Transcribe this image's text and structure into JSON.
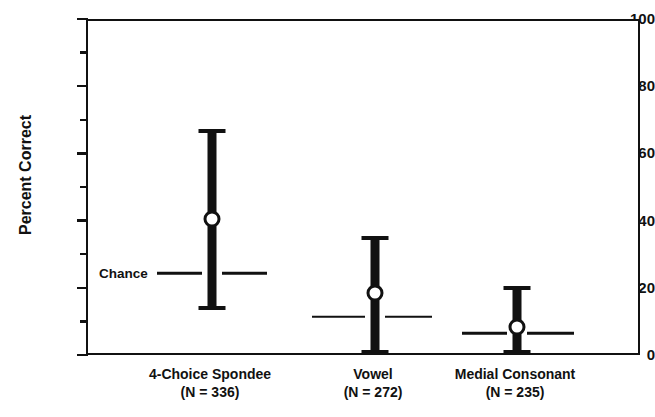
{
  "chart_data": {
    "type": "bar",
    "title": "",
    "xlabel": "",
    "ylabel": "Percent Correct",
    "ylim": [
      0,
      100
    ],
    "ytick_major": [
      0,
      20,
      40,
      60,
      80,
      100
    ],
    "ytick_minor": [
      10,
      30,
      50,
      70,
      90
    ],
    "ytick_labels": [
      "0",
      "20",
      "40",
      "60",
      "80",
      "100"
    ],
    "grid": false,
    "legend": "none",
    "chance_label": "Chance",
    "categories": [
      "4-Choice Spondee",
      "Vowel",
      "Medial Consonant"
    ],
    "category_n": [
      "(N = 336)",
      "(N = 272)",
      "(N = 235)"
    ],
    "series": [
      {
        "name": "mean",
        "marker": "open-circle",
        "values": [
          41,
          19,
          9
        ]
      },
      {
        "name": "range-high",
        "values": [
          68,
          36,
          21
        ]
      },
      {
        "name": "range-low",
        "values": [
          14,
          1,
          1
        ]
      },
      {
        "name": "chance",
        "values": [
          25,
          12,
          7
        ]
      }
    ],
    "points": [
      {
        "category": "4-Choice Spondee",
        "n": "(N = 336)",
        "mean": 41,
        "high": 68,
        "low": 14,
        "chance": 25
      },
      {
        "category": "Vowel",
        "n": "(N = 272)",
        "mean": 19,
        "high": 36,
        "low": 1,
        "chance": 12
      },
      {
        "category": "Medial Consonant",
        "n": "(N = 235)",
        "mean": 9,
        "high": 21,
        "low": 1,
        "chance": 7
      }
    ],
    "colors": {
      "bar": "#111111",
      "marker_fill": "#ffffff",
      "axis": "#111111",
      "background": "#ffffff"
    }
  }
}
